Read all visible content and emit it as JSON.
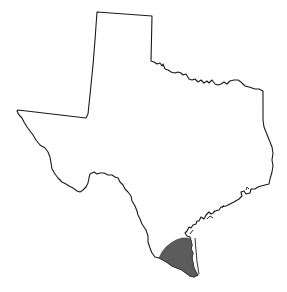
{
  "map": {
    "subject": "Texas state outline",
    "highlighted_region": "South Texas (lower Rio Grande Valley / Coastal Bend)",
    "colors": {
      "background": "#ffffff",
      "outline": "#1a1a1a",
      "highlight_fill": "#5c5c5c"
    }
  }
}
